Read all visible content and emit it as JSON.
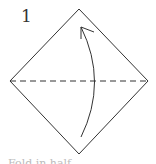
{
  "diagram": {
    "step_number": "1",
    "caption": "Fold in half",
    "shape": "square-diamond",
    "fold_line": "horizontal-dashed-valley",
    "arrow": "curved-bottom-to-top",
    "colors": {
      "line": "#333333",
      "background": "#ffffff"
    }
  }
}
